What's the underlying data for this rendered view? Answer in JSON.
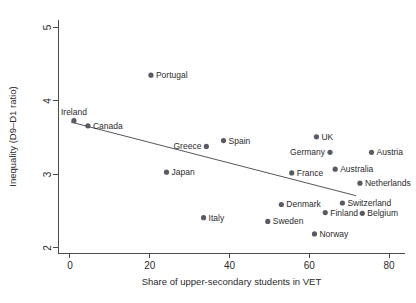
{
  "chart_data": {
    "type": "scatter",
    "title": "",
    "xlabel": "Share of upper-secondary students in VET",
    "ylabel": "Inequality (D9–D1 ratio)",
    "xlim": [
      -3,
      84
    ],
    "ylim": [
      1.93,
      5.1
    ],
    "xticks": [
      0,
      20,
      40,
      60,
      80
    ],
    "yticks": [
      2,
      3,
      4,
      5
    ],
    "xtick_labels": [
      "0",
      "20",
      "40",
      "60",
      "80"
    ],
    "ytick_labels": [
      "2",
      "3",
      "4",
      "5"
    ],
    "grid": false,
    "legend": "none",
    "marker_color": "#5a5a66",
    "fit_line_color": "#55555f",
    "fit_line": {
      "x": [
        0.3,
        71.7
      ],
      "y": [
        3.71,
        2.71
      ]
    },
    "points": [
      {
        "name": "Portugal",
        "x": 20.3,
        "y": 4.35,
        "label_pos": "right"
      },
      {
        "name": "Ireland",
        "x": 1.0,
        "y": 3.73,
        "label_pos": "above"
      },
      {
        "name": "Canada",
        "x": 4.5,
        "y": 3.66,
        "label_pos": "right"
      },
      {
        "name": "Greece",
        "x": 34.2,
        "y": 3.38,
        "label_pos": "left"
      },
      {
        "name": "Spain",
        "x": 38.5,
        "y": 3.46,
        "label_pos": "right"
      },
      {
        "name": "Japan",
        "x": 24.2,
        "y": 3.03,
        "label_pos": "right"
      },
      {
        "name": "UK",
        "x": 61.8,
        "y": 3.51,
        "label_pos": "right"
      },
      {
        "name": "Germany",
        "x": 65.2,
        "y": 3.3,
        "label_pos": "left"
      },
      {
        "name": "Austria",
        "x": 75.6,
        "y": 3.3,
        "label_pos": "right"
      },
      {
        "name": "Australia",
        "x": 66.5,
        "y": 3.07,
        "label_pos": "right"
      },
      {
        "name": "France",
        "x": 55.6,
        "y": 3.02,
        "label_pos": "right"
      },
      {
        "name": "Netherlands",
        "x": 72.7,
        "y": 2.88,
        "label_pos": "right"
      },
      {
        "name": "Italy",
        "x": 33.5,
        "y": 2.41,
        "label_pos": "right"
      },
      {
        "name": "Denmark",
        "x": 53.0,
        "y": 2.59,
        "label_pos": "right"
      },
      {
        "name": "Switzerland",
        "x": 68.3,
        "y": 2.61,
        "label_pos": "right"
      },
      {
        "name": "Finland",
        "x": 64.0,
        "y": 2.48,
        "label_pos": "right"
      },
      {
        "name": "Belgium",
        "x": 73.3,
        "y": 2.47,
        "label_pos": "right"
      },
      {
        "name": "Sweden",
        "x": 49.6,
        "y": 2.36,
        "label_pos": "right"
      },
      {
        "name": "Norway",
        "x": 61.3,
        "y": 2.19,
        "label_pos": "right"
      }
    ]
  }
}
